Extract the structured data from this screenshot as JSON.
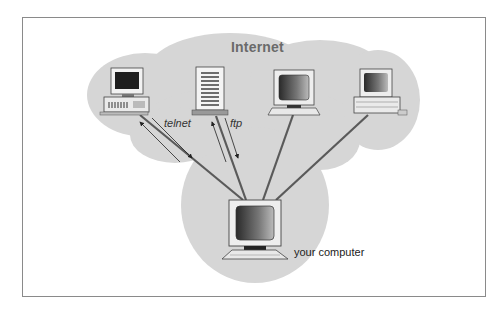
{
  "diagram": {
    "title": "Internet",
    "nodes": [
      {
        "id": "telnet-host",
        "type": "desktop-computer",
        "connection": "telnet"
      },
      {
        "id": "ftp-server",
        "type": "server",
        "connection": "ftp"
      },
      {
        "id": "remote-monitor",
        "type": "monitor-computer",
        "connection": ""
      },
      {
        "id": "remote-laptop",
        "type": "compact-computer",
        "connection": ""
      },
      {
        "id": "your-computer",
        "type": "monitor-computer",
        "label": "your computer"
      }
    ],
    "edges": [
      {
        "from": "your-computer",
        "to": "telnet-host",
        "label": "telnet",
        "bidirectional_arrows": true
      },
      {
        "from": "your-computer",
        "to": "ftp-server",
        "label": "ftp",
        "bidirectional_arrows": true
      },
      {
        "from": "your-computer",
        "to": "remote-monitor",
        "label": ""
      },
      {
        "from": "your-computer",
        "to": "remote-laptop",
        "label": ""
      }
    ],
    "labels": {
      "telnet": "telnet",
      "ftp": "ftp",
      "your_computer": "your computer"
    },
    "colors": {
      "cloud": "#d6d6d6",
      "frame_border": "#8a8a8a",
      "line": "#5a5a5a",
      "title": "#6a6a6a"
    }
  }
}
